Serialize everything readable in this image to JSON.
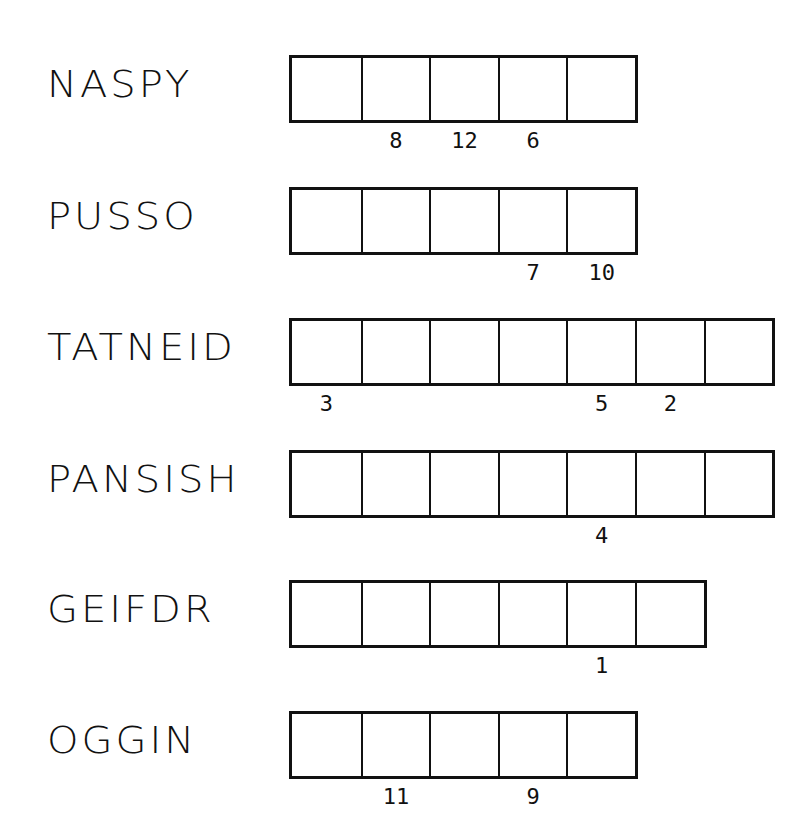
{
  "puzzle": {
    "rows": [
      {
        "word": "NASPY",
        "top": 55,
        "cells": [
          "",
          "8",
          "12",
          "6",
          ""
        ]
      },
      {
        "word": "PUSSO",
        "top": 187,
        "cells": [
          "",
          "",
          "",
          "7",
          "10"
        ]
      },
      {
        "word": "TATNEID",
        "top": 318,
        "cells": [
          "3",
          "",
          "",
          "",
          "5",
          "2",
          ""
        ]
      },
      {
        "word": "PANSISH",
        "top": 450,
        "cells": [
          "",
          "",
          "",
          "",
          "4",
          "",
          ""
        ]
      },
      {
        "word": "GEIFDR",
        "top": 580,
        "cells": [
          "",
          "",
          "",
          "",
          "1",
          ""
        ]
      },
      {
        "word": "OGGIN",
        "top": 711,
        "cells": [
          "",
          "11",
          "",
          "9",
          ""
        ]
      }
    ]
  },
  "colors": {
    "ink": "#111111",
    "background": "#ffffff"
  }
}
